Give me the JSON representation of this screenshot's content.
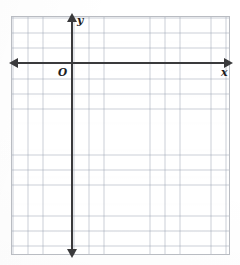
{
  "figure": {
    "kind": "coordinate-plane"
  },
  "axes": {
    "x": {
      "label": "x",
      "arrow_left": "arrow-left",
      "arrow_right": "arrow-right"
    },
    "y": {
      "label": "y",
      "arrow_up": "arrow-up",
      "arrow_down": "arrow-down"
    },
    "origin": {
      "label": "O"
    }
  },
  "chart_data": {
    "type": "scatter",
    "title": "",
    "xlabel": "x",
    "ylabel": "y",
    "origin_label": "O",
    "grid": true,
    "grid_cell_px": 15.2,
    "columns": 14,
    "rows": 15,
    "x_axis_row_from_top": 3,
    "y_axis_col_from_left": 4,
    "xlim": [
      -4,
      10
    ],
    "ylim": [
      -12,
      3
    ],
    "xticks": [],
    "yticks": [],
    "series": [],
    "x": [],
    "values": [],
    "legend": [],
    "annotations": []
  },
  "colors": {
    "grid_line": "#96a0af",
    "axis": "#3a3a3c",
    "border": "#b9bcc2",
    "background": "#ffffff",
    "label_text": "#1d1d1f"
  }
}
